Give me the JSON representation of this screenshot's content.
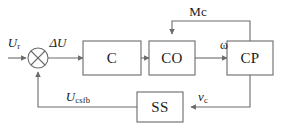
{
  "diagram": {
    "type": "control-system-block-diagram",
    "title": "",
    "stroke_color": "#6b6b6b",
    "text_color": "#1a1a1a",
    "background": "#ffffff",
    "blocks": [
      {
        "id": "c",
        "label": "C",
        "x": 112,
        "y": 58,
        "w": 58,
        "h": 34
      },
      {
        "id": "co",
        "label": "CO",
        "x": 172,
        "y": 58,
        "w": 46,
        "h": 34
      },
      {
        "id": "cp",
        "label": "CP",
        "x": 250,
        "y": 58,
        "w": 46,
        "h": 34
      },
      {
        "id": "ss",
        "label": "SS",
        "x": 160,
        "y": 107,
        "w": 46,
        "h": 30
      }
    ],
    "summing_junction": {
      "id": "sum",
      "symbol": "cross-circle",
      "x": 38,
      "y": 58,
      "r": 10
    },
    "signals": [
      {
        "id": "ur",
        "base": "U",
        "subscript": "r",
        "italic": true,
        "x": 14,
        "y": 42
      },
      {
        "id": "du",
        "base": "ΔU",
        "subscript": "",
        "italic": true,
        "x": 58,
        "y": 42
      },
      {
        "id": "omega",
        "base": "ω",
        "subscript": "",
        "italic": false,
        "x": 224,
        "y": 45
      },
      {
        "id": "mc",
        "base": "Mc",
        "subscript": "",
        "italic": false,
        "x": 198,
        "y": 11
      },
      {
        "id": "ucsfb",
        "base": "U",
        "subscript": "csfb",
        "italic": true,
        "x": 78,
        "y": 96
      },
      {
        "id": "vc",
        "base": "v",
        "subscript": "c",
        "italic": true,
        "x": 203,
        "y": 96
      }
    ],
    "connections": [
      {
        "id": "input-to-sum",
        "from": "input",
        "to": "sum"
      },
      {
        "id": "sum-to-c",
        "from": "sum",
        "to": "c"
      },
      {
        "id": "c-to-co",
        "from": "c",
        "to": "co"
      },
      {
        "id": "co-to-cp",
        "from": "co",
        "to": "cp"
      },
      {
        "id": "cp-to-co-mc",
        "from": "cp",
        "to": "co"
      },
      {
        "id": "cp-to-ss-vc",
        "from": "cp",
        "to": "ss"
      },
      {
        "id": "ss-to-sum",
        "from": "ss",
        "to": "sum"
      }
    ]
  }
}
